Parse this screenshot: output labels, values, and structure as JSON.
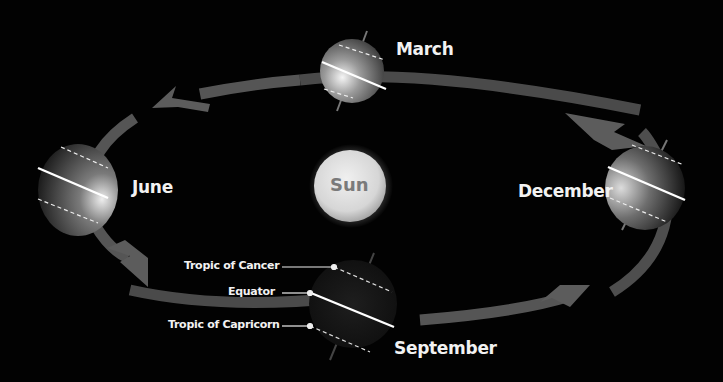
{
  "diagram": {
    "center": {
      "label": "Sun"
    },
    "positions": [
      {
        "id": "march",
        "label": "March"
      },
      {
        "id": "june",
        "label": "June"
      },
      {
        "id": "september",
        "label": "September"
      },
      {
        "id": "december",
        "label": "December"
      }
    ],
    "callouts": [
      {
        "id": "tropic-cancer",
        "label": "Tropic of Cancer"
      },
      {
        "id": "equator",
        "label": "Equator"
      },
      {
        "id": "tropic-capricorn",
        "label": "Tropic of Capricorn"
      }
    ],
    "colors": {
      "background": "#020202",
      "orbit": "#5a5a5a",
      "sun": "#dcdcdc",
      "sun_text": "#7a7a7a",
      "text": "#f2f2f2"
    }
  }
}
